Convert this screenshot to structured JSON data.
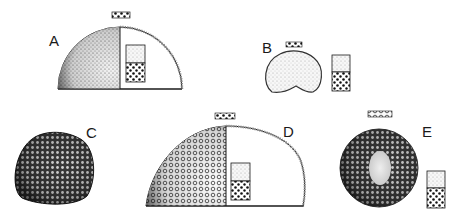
{
  "figure": {
    "panels": [
      {
        "id": "A",
        "label": "A",
        "shape": "half-section hemisphere",
        "fill_left": "fine stipple",
        "inset": "fine/coarse two-layer swatch"
      },
      {
        "id": "B",
        "label": "B",
        "shape": "rounded dome",
        "fill": "fine stipple",
        "inset": "fine/coarse two-layer swatch"
      },
      {
        "id": "C",
        "label": "C",
        "shape": "rounded dome",
        "fill": "dense coarse cells"
      },
      {
        "id": "D",
        "label": "D",
        "shape": "half-section hemisphere",
        "fill_left": "coarse cells",
        "inset": "fine/coarse two-layer swatch"
      },
      {
        "id": "E",
        "label": "E",
        "shape": "sphere with pale core",
        "fill": "dense coarse cells",
        "inset": "fine/coarse two-layer swatch"
      }
    ]
  },
  "colors": {
    "ink": "#1a1a1a",
    "paper": "#ffffff",
    "light_stipple": "#bdbdbd",
    "mid_stipple": "#7a7a7a"
  }
}
